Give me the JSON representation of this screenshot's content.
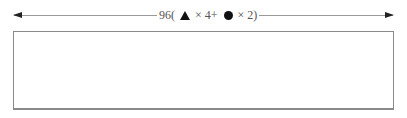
{
  "dimension": {
    "total": "96(",
    "shape1_icon": "triangle-icon",
    "shape1_multiplier": "× 4+",
    "shape2_icon": "circle-icon",
    "shape2_multiplier": "× 2)",
    "full_label": "96( ▲ × 4+ ● × 2)"
  },
  "colors": {
    "line": "#9a9a9a",
    "arrowhead": "#222222",
    "box_border": "#8a8a8a",
    "text": "#555555"
  }
}
